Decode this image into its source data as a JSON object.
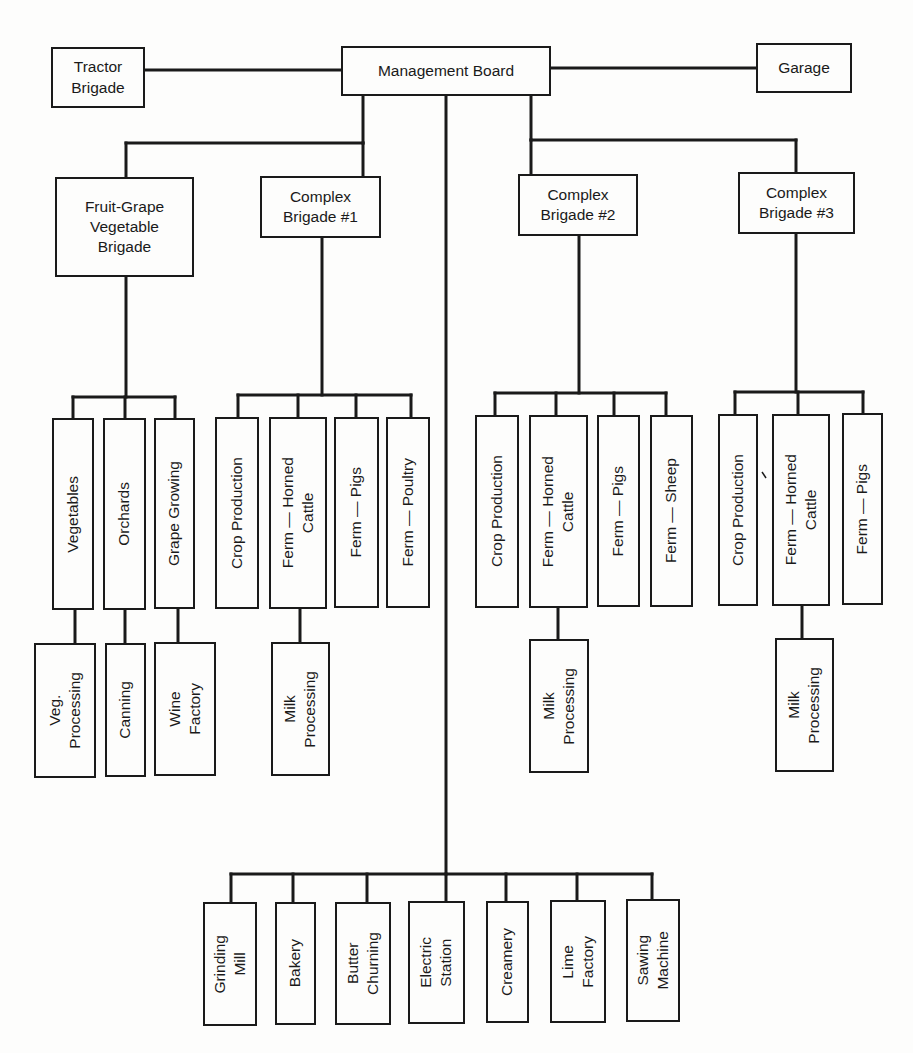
{
  "diagram": {
    "type": "organizational-chart",
    "root": {
      "label": "Management Board"
    },
    "side_units": [
      {
        "label": "Tractor\nBrigade",
        "position": "left"
      },
      {
        "label": "Garage",
        "position": "right"
      }
    ],
    "brigades": [
      {
        "label": "Fruit-Grape\nVegetable\nBrigade",
        "units": [
          {
            "label": "Vegetables",
            "processing": "Veg.\nProcessing"
          },
          {
            "label": "Orchards",
            "processing": "Canning"
          },
          {
            "label": "Grape Growing",
            "processing": "Wine\nFactory"
          }
        ]
      },
      {
        "label": "Complex\nBrigade #1",
        "units": [
          {
            "label": "Crop Production"
          },
          {
            "label": "Ferm — Horned\nCattle",
            "processing": "Milk\nProcessing"
          },
          {
            "label": "Ferm — Pigs"
          },
          {
            "label": "Ferm — Poultry"
          }
        ]
      },
      {
        "label": "Complex\nBrigade #2",
        "units": [
          {
            "label": "Crop Production"
          },
          {
            "label": "Ferm — Horned\nCattle",
            "processing": "Milk\nProcessing"
          },
          {
            "label": "Ferm — Pigs"
          },
          {
            "label": "Ferm — Sheep"
          }
        ]
      },
      {
        "label": "Complex\nBrigade #3",
        "units": [
          {
            "label": "Crop Production"
          },
          {
            "label": "Ferm — Horned\nCattle",
            "processing": "Milk\nProcessing"
          },
          {
            "label": "Ferm — Pigs"
          }
        ]
      }
    ],
    "enterprises": [
      {
        "label": "Grinding\nMill"
      },
      {
        "label": "Bakery"
      },
      {
        "label": "Butter\nChurning"
      },
      {
        "label": "Electric\nStation"
      },
      {
        "label": "Creamery"
      },
      {
        "label": "Lime\nFactory"
      },
      {
        "label": "Sawing\nMachine"
      }
    ],
    "colors": {
      "line": "#1a1a1a",
      "background": "#fdfdfc"
    }
  }
}
